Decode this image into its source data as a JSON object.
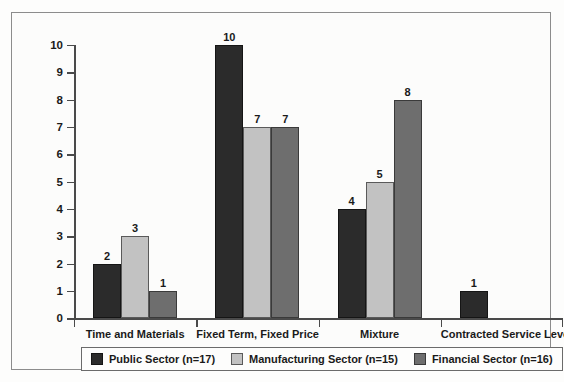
{
  "chart_data": {
    "type": "bar",
    "title": "",
    "subtitle": "",
    "xlabel": "",
    "ylabel": "",
    "ylim": [
      0,
      10
    ],
    "yticks": [
      0,
      1,
      2,
      3,
      4,
      5,
      6,
      7,
      8,
      9,
      10
    ],
    "grid": false,
    "legend_position": "bottom",
    "categories": [
      "Time and Materials",
      "Fixed Term, Fixed Price",
      "Mixture",
      "Contracted Service Level"
    ],
    "series": [
      {
        "name": "Public Sector (n=17)",
        "color": "#2b2b2b",
        "values": [
          2,
          10,
          4,
          1
        ]
      },
      {
        "name": "Manufacturing Sector (n=15)",
        "color": "#c2c2c2",
        "values": [
          3,
          7,
          5,
          null
        ]
      },
      {
        "name": "Financial Sector (n=16)",
        "color": "#6e6e6e",
        "values": [
          1,
          7,
          8,
          null
        ]
      }
    ],
    "bar_labels": [
      [
        "2",
        "3",
        "1"
      ],
      [
        "10",
        "7",
        "7"
      ],
      [
        "4",
        "5",
        "8"
      ],
      [
        "1",
        "",
        ""
      ]
    ]
  },
  "legend": {
    "items": [
      {
        "label": "Public Sector (n=17)",
        "swatch": "s0"
      },
      {
        "label": "Manufacturing Sector (n=15)",
        "swatch": "s1"
      },
      {
        "label": "Financial Sector (n=16)",
        "swatch": "s2"
      }
    ]
  },
  "axis": {
    "y_tick_labels": [
      "10",
      "9",
      "8",
      "7",
      "6",
      "5",
      "4",
      "3",
      "2",
      "1",
      "0"
    ]
  },
  "colors": {
    "series_public": "#2b2b2b",
    "series_manufacturing": "#c2c2c2",
    "series_financial": "#6e6e6e",
    "axis": "#4a4a4a",
    "frame": "#8c8c8c",
    "background": "#fcfcfb",
    "text": "#1a1a1a"
  }
}
